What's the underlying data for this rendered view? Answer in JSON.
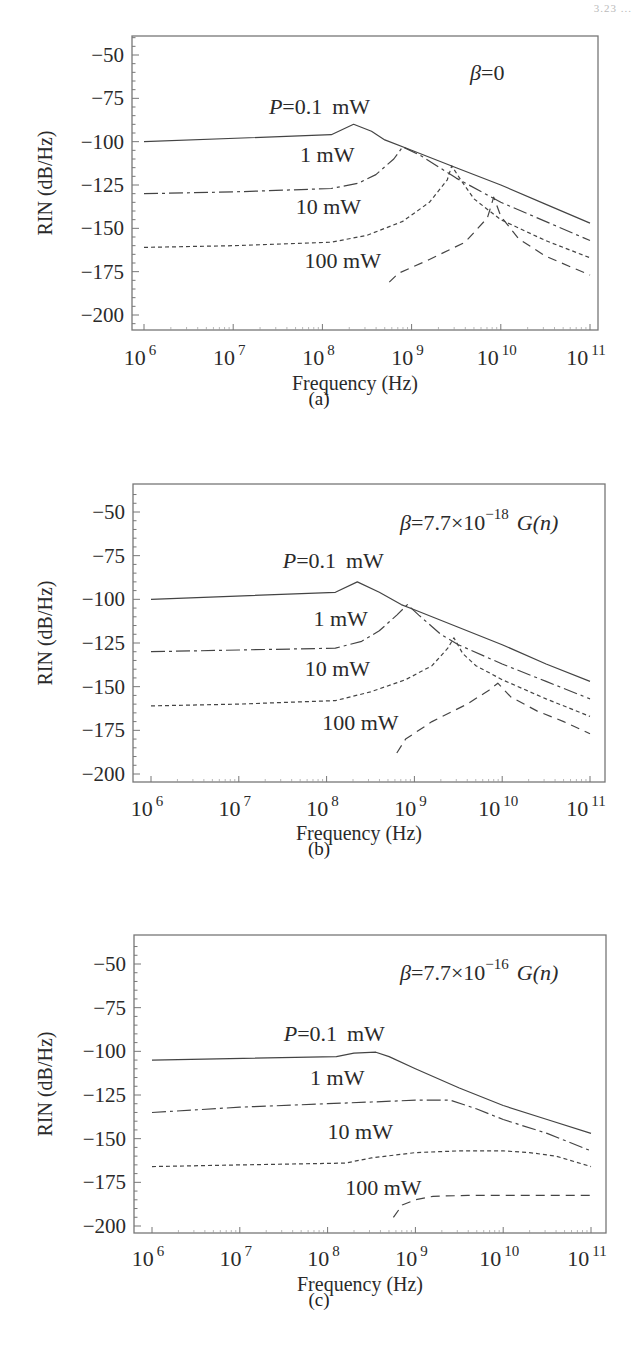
{
  "page": {
    "corner_text": "3.23 ..."
  },
  "chart_data": [
    {
      "id": "a",
      "type": "line",
      "caption": "(a)",
      "annotation": "β=0",
      "title": "",
      "xlabel": "Frequency   (Hz)",
      "ylabel": "RIN (dB/Hz)",
      "xscale": "log",
      "xlim": [
        1000000.0,
        100000000000.0
      ],
      "ylim": [
        -210,
        -40
      ],
      "xticks": [
        "10^6",
        "10^7",
        "10^8",
        "10^9",
        "10^10",
        "10^11"
      ],
      "yticks": [
        -50,
        -75,
        -100,
        -125,
        -150,
        -175,
        -200
      ],
      "grid": false,
      "legend": "inline labels",
      "series": [
        {
          "name": "P=0.1 mW",
          "style": "solid",
          "x": [
            6,
            8.1,
            8.35,
            8.55,
            8.7,
            9,
            9.5,
            10,
            10.5,
            11
          ],
          "y": [
            -100,
            -96,
            -90,
            -94,
            -99,
            -105,
            -115,
            -125,
            -136,
            -147
          ]
        },
        {
          "name": "1 mW",
          "style": "dashdot",
          "x": [
            6,
            7,
            8.1,
            8.4,
            8.6,
            8.8,
            8.9,
            9.1,
            9.5,
            10,
            10.5,
            11
          ],
          "y": [
            -130,
            -129,
            -127,
            -124,
            -119,
            -110,
            -103,
            -108,
            -121,
            -135,
            -146,
            -157
          ]
        },
        {
          "name": "10 mW",
          "style": "dotted",
          "x": [
            6,
            7,
            8.1,
            8.5,
            8.9,
            9.2,
            9.4,
            9.45,
            9.55,
            9.7,
            10,
            10.5,
            11
          ],
          "y": [
            -161,
            -160,
            -158,
            -154,
            -146,
            -135,
            -122,
            -114,
            -122,
            -133,
            -145,
            -157,
            -167
          ]
        },
        {
          "name": "100 mW",
          "style": "dashed",
          "x": [
            8.75,
            8.85,
            9.2,
            9.6,
            9.85,
            9.92,
            10.0,
            10.2,
            10.5,
            11
          ],
          "y": [
            -181,
            -176,
            -168,
            -158,
            -144,
            -132,
            -143,
            -156,
            -166,
            -177
          ]
        }
      ],
      "labels": [
        {
          "text": "P=0.1 mW",
          "x": 7.4,
          "y": -84
        },
        {
          "text": "1 mW",
          "x": 7.75,
          "y": -112
        },
        {
          "text": "10 mW",
          "x": 7.7,
          "y": -142
        },
        {
          "text": "100 mW",
          "x": 7.8,
          "y": -173
        }
      ]
    },
    {
      "id": "b",
      "type": "line",
      "caption": "(b)",
      "annotation": "β=7.7×10^-18 G(n)",
      "title": "",
      "xlabel": "Frequency   (Hz)",
      "ylabel": "RIN (dB/Hz)",
      "xscale": "log",
      "xlim": [
        1000000.0,
        100000000000.0
      ],
      "ylim": [
        -210,
        -40
      ],
      "xticks": [
        "10^6",
        "10^7",
        "10^8",
        "10^9",
        "10^10",
        "10^11"
      ],
      "yticks": [
        -50,
        -75,
        -100,
        -125,
        -150,
        -175,
        -200
      ],
      "grid": false,
      "legend": "inline labels",
      "series": [
        {
          "name": "P=0.1 mW",
          "style": "solid",
          "x": [
            6,
            8.1,
            8.35,
            8.6,
            8.85,
            9,
            9.5,
            10,
            10.5,
            11
          ],
          "y": [
            -100,
            -96,
            -90,
            -96,
            -103,
            -106,
            -116,
            -126,
            -137,
            -147
          ]
        },
        {
          "name": "1 mW",
          "style": "dashdot",
          "x": [
            6,
            7,
            8.1,
            8.4,
            8.6,
            8.8,
            8.92,
            9.05,
            9.3,
            9.5,
            10,
            10.5,
            11
          ],
          "y": [
            -130,
            -129,
            -128,
            -124,
            -118,
            -109,
            -103,
            -109,
            -120,
            -126,
            -137,
            -147,
            -157
          ]
        },
        {
          "name": "10 mW",
          "style": "dotted",
          "x": [
            6,
            7,
            8.1,
            8.5,
            8.9,
            9.2,
            9.38,
            9.45,
            9.55,
            9.7,
            10,
            10.5,
            11
          ],
          "y": [
            -161,
            -160,
            -158,
            -153,
            -146,
            -138,
            -128,
            -122,
            -131,
            -138,
            -146,
            -157,
            -167
          ]
        },
        {
          "name": "100 mW",
          "style": "dashed",
          "x": [
            8.8,
            8.9,
            9.2,
            9.6,
            9.85,
            9.95,
            10.1,
            10.4,
            10.7,
            11
          ],
          "y": [
            -188,
            -180,
            -170,
            -160,
            -152,
            -148,
            -156,
            -164,
            -170,
            -177
          ]
        }
      ],
      "labels": [
        {
          "text": "P=0.1 mW",
          "x": 7.5,
          "y": -82
        },
        {
          "text": "1 mW",
          "x": 7.85,
          "y": -115
        },
        {
          "text": "10 mW",
          "x": 7.75,
          "y": -144
        },
        {
          "text": "100 mW",
          "x": 7.95,
          "y": -175
        }
      ]
    },
    {
      "id": "c",
      "type": "line",
      "caption": "(c)",
      "annotation": "β=7.7×10^-16 G(n)",
      "title": "",
      "xlabel": "Frequency   (Hz)",
      "ylabel": "RIN (dB/Hz)",
      "xscale": "log",
      "xlim": [
        1000000.0,
        100000000000.0
      ],
      "ylim": [
        -210,
        -40
      ],
      "xticks": [
        "10^6",
        "10^7",
        "10^8",
        "10^9",
        "10^10",
        "10^11"
      ],
      "yticks": [
        -50,
        -75,
        -100,
        -125,
        -150,
        -175,
        -200
      ],
      "grid": false,
      "legend": "inline labels",
      "series": [
        {
          "name": "P=0.1 mW",
          "style": "solid",
          "x": [
            6,
            8.1,
            8.3,
            8.55,
            8.7,
            9,
            9.5,
            10,
            10.5,
            11
          ],
          "y": [
            -105,
            -103,
            -101,
            -100.5,
            -103,
            -110,
            -121,
            -131,
            -139,
            -147
          ]
        },
        {
          "name": "1 mW",
          "style": "dashdot",
          "x": [
            6,
            7,
            8,
            8.5,
            9,
            9.4,
            9.7,
            10,
            10.5,
            11
          ],
          "y": [
            -135,
            -132,
            -130,
            -129,
            -128,
            -128,
            -133,
            -139,
            -147,
            -157
          ]
        },
        {
          "name": "10 mW",
          "style": "dotted",
          "x": [
            6,
            7,
            8.2,
            8.5,
            9,
            9.5,
            10,
            10.3,
            10.6,
            11
          ],
          "y": [
            -166,
            -165,
            -164,
            -161,
            -158,
            -157,
            -157,
            -158,
            -160,
            -166
          ]
        },
        {
          "name": "100 mW",
          "style": "dashed",
          "x": [
            8.75,
            8.85,
            9.0,
            9.2,
            9.6,
            10,
            10.5,
            11
          ],
          "y": [
            -195,
            -188,
            -185,
            -183,
            -182.5,
            -182.5,
            -182.5,
            -182.5
          ]
        }
      ],
      "labels": [
        {
          "text": "P=0.1 mW",
          "x": 7.5,
          "y": -94
        },
        {
          "text": "1 mW",
          "x": 7.8,
          "y": -119
        },
        {
          "text": "10 mW",
          "x": 8.0,
          "y": -150
        },
        {
          "text": "100 mW",
          "x": 8.2,
          "y": -182
        }
      ]
    }
  ],
  "panels": [
    {
      "caption": "(a)",
      "annotation_beta": "β",
      "annotation_rest": "=0",
      "annotation_exp": "",
      "annotation_tail": ""
    },
    {
      "caption": "(b)",
      "annotation_beta": "β",
      "annotation_rest": "=7.7×10",
      "annotation_exp": "−18",
      "annotation_tail": "G(n)"
    },
    {
      "caption": "(c)",
      "annotation_beta": "β",
      "annotation_rest": "=7.7×10",
      "annotation_exp": "−16",
      "annotation_tail": "G(n)"
    }
  ],
  "axis": {
    "xlabel": "Frequency   (Hz)",
    "ylabel": "RIN (dB/Hz)",
    "ytick_labels": [
      "−50",
      "−75",
      "−100",
      "−125",
      "−150",
      "−175",
      "−200"
    ],
    "xtick_base": "10",
    "xtick_exps": [
      "6",
      "7",
      "8",
      "9",
      "10",
      "11"
    ]
  }
}
